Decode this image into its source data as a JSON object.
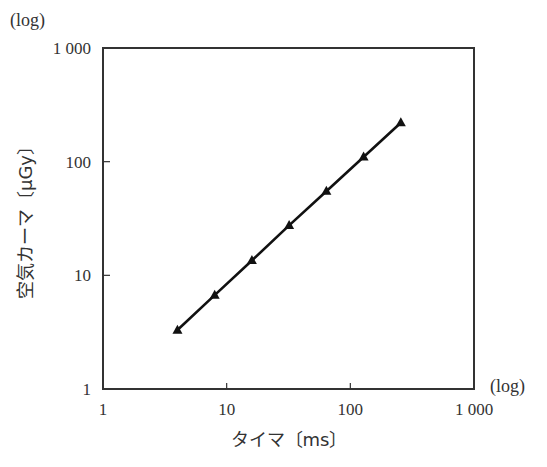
{
  "chart_data": {
    "type": "line",
    "title": "",
    "xlabel": "タイマ〔ms〕",
    "ylabel": "空気カーマ〔μGy〕",
    "xscale": "log",
    "yscale": "log",
    "x_log_note": "(log)",
    "y_log_note": "(log)",
    "xlim": [
      1,
      1000
    ],
    "ylim": [
      1,
      1000
    ],
    "x_ticks": [
      1,
      10,
      100,
      1000
    ],
    "y_ticks": [
      1,
      10,
      100,
      1000
    ],
    "x_tick_labels": [
      "1",
      "10",
      "100",
      "1 000"
    ],
    "y_tick_labels": [
      "1",
      "10",
      "100",
      "1 000"
    ],
    "grid": false,
    "legend": null,
    "series": [
      {
        "name": "空気カーマ",
        "marker": "triangle",
        "color": "#111111",
        "x": [
          4,
          8,
          16,
          32,
          64,
          128,
          256
        ],
        "y": [
          3.3,
          6.7,
          13.5,
          27.5,
          55,
          110,
          220
        ]
      }
    ]
  }
}
